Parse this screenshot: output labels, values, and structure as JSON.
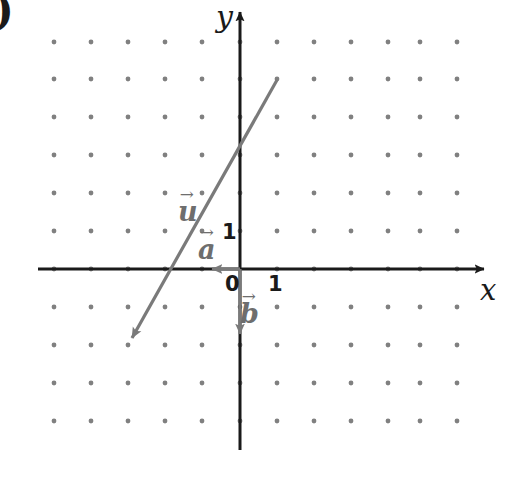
{
  "figure": {
    "kind": "cartesian-vector-diagram",
    "width": 514,
    "height": 479,
    "background_color": "#ffffff",
    "corner_mark": ")"
  },
  "axes": {
    "x_label": "x",
    "y_label": "y",
    "axis_color": "#1a1a1a",
    "origin_px": {
      "x": 240,
      "y": 269
    },
    "unit_px": 37,
    "x_range": [
      -5.0,
      6.8
    ],
    "y_range": [
      -4.9,
      7.1
    ]
  },
  "ticks": {
    "origin": "0",
    "x_one": "1",
    "y_one": "1"
  },
  "grid": {
    "dot_color": "#808080",
    "dot_radius": 2.4,
    "spacing_px": 37,
    "columns": 12,
    "rows": 11,
    "first_dot_px": {
      "x": 54,
      "y": 42
    }
  },
  "vectors": [
    {
      "name": "u",
      "label": "u",
      "color": "#7a7a7a",
      "components": [
        -4,
        -7.2
      ],
      "tail_px": {
        "x": 277,
        "y": 80
      },
      "head_px": {
        "x": 128,
        "y": 345
      },
      "has_arrowhead": true,
      "label_px": {
        "x": 178,
        "y": 186
      }
    },
    {
      "name": "a",
      "label": "a",
      "color": "#7a7a7a",
      "components": [
        -1,
        0
      ],
      "tail_px": {
        "x": 240,
        "y": 269
      },
      "head_px": {
        "x": 203,
        "y": 269
      },
      "has_arrowhead": true,
      "label_px": {
        "x": 198,
        "y": 224
      }
    },
    {
      "name": "b",
      "label": "b",
      "color": "#7a7a7a",
      "components": [
        0,
        -2
      ],
      "tail_px": {
        "x": 240,
        "y": 269
      },
      "head_px": {
        "x": 240,
        "y": 343
      },
      "has_arrowhead": true,
      "label_px": {
        "x": 240,
        "y": 288
      }
    }
  ],
  "arrow_glyph": "→"
}
